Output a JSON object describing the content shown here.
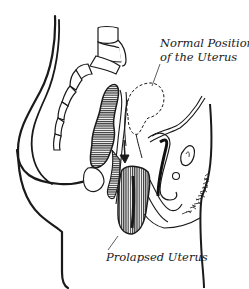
{
  "diagram": {
    "type": "anatomical-illustration",
    "colors": {
      "line": "#1a1a1a",
      "background": "#ffffff",
      "hatch": "#333333"
    },
    "labels": {
      "normal_position_line1": "Normal Position",
      "normal_position_line2": "of the Uterus",
      "prolapsed": "Prolapsed Uterus"
    },
    "structures": [
      "body-outline",
      "spine-sacrum",
      "rectum",
      "normal-uterus-dashed-outline",
      "prolapsed-uterus",
      "bladder",
      "pubic-bone",
      "downward-arrow",
      "pubic-hair"
    ]
  }
}
